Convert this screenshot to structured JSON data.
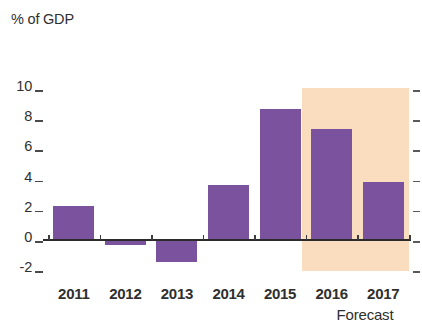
{
  "chart_data": {
    "type": "bar",
    "title": "",
    "subtitle": "",
    "xlabel": "",
    "ylabel": "% of GDP",
    "categories": [
      "2011",
      "2012",
      "2013",
      "2014",
      "2015",
      "2016",
      "2017"
    ],
    "values": [
      2.2,
      -0.4,
      -1.5,
      3.6,
      8.6,
      7.3,
      3.8
    ],
    "series": [
      {
        "name": "% of GDP",
        "values": [
          2.2,
          -0.4,
          -1.5,
          3.6,
          8.6,
          7.3,
          3.8
        ]
      }
    ],
    "ylim": [
      -2,
      10
    ],
    "yticks": [
      10,
      8,
      6,
      4,
      2,
      0,
      -2
    ],
    "ytick_labels": [
      "10",
      "8",
      "6",
      "4",
      "2",
      "0",
      "-2"
    ],
    "grid": false,
    "legend": false,
    "legend_position": "none",
    "bar_color": "#7b529e",
    "zero_line_color": "#2b2b2b",
    "annotations": [
      {
        "text": "Forecast",
        "categories": [
          "2016",
          "2017"
        ],
        "shading_color": "#f9ddbe"
      }
    ],
    "forecast_start_category": "2016",
    "forecast_caption": "Forecast"
  },
  "axis": {
    "y_title": "% of GDP",
    "ticks": [
      {
        "label": "10",
        "value": 10
      },
      {
        "label": "8",
        "value": 8
      },
      {
        "label": "6",
        "value": 6
      },
      {
        "label": "4",
        "value": 4
      },
      {
        "label": "2",
        "value": 2
      },
      {
        "label": "0",
        "value": 0
      },
      {
        "label": "-2",
        "value": -2
      }
    ]
  },
  "colors": {
    "bar": "#7b529e",
    "forecast_band": "#f9ddbe",
    "axis": "#2b2b2b",
    "text": "#2f2f2f",
    "background": "#ffffff"
  }
}
